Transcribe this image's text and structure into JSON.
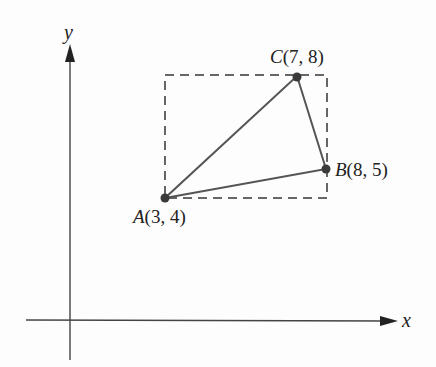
{
  "diagram": {
    "type": "coordinate-geometry",
    "axes": {
      "x_label": "x",
      "y_label": "y"
    },
    "points": [
      {
        "name": "A",
        "coords": "(3, 4)",
        "x": 3,
        "y": 4
      },
      {
        "name": "B",
        "coords": "(8, 5)",
        "x": 8,
        "y": 5
      },
      {
        "name": "C",
        "coords": "(7, 8)",
        "x": 7,
        "y": 8
      }
    ],
    "triangle": [
      "A",
      "B",
      "C"
    ],
    "bounding_rectangle": {
      "style": "dashed",
      "x_range": [
        3,
        8
      ],
      "y_range": [
        4,
        8
      ]
    },
    "colors": {
      "line": "#555555",
      "axis": "#444444",
      "point": "#3a3a3a",
      "dash": "#666666"
    }
  }
}
